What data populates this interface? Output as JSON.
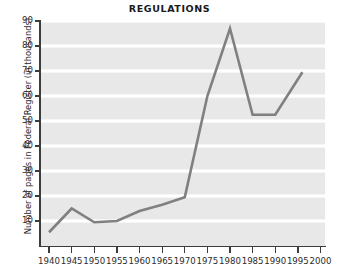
{
  "chart_data": {
    "type": "line",
    "title": "REGULATIONS",
    "xlabel": "",
    "ylabel": "Number of pages in Federal Register (in thousands)",
    "x": [
      1940,
      1945,
      1950,
      1955,
      1960,
      1965,
      1970,
      1975,
      1980,
      1985,
      1990,
      1996
    ],
    "values": [
      5.5,
      15,
      9.5,
      10,
      14,
      16.5,
      19.5,
      60,
      87,
      52.5,
      52.5,
      69.5
    ],
    "series": [
      {
        "name": "Pages in Federal Register",
        "values": [
          5.5,
          15,
          9.5,
          10,
          14,
          16.5,
          19.5,
          60,
          87,
          52.5,
          52.5,
          69.5
        ]
      }
    ],
    "xlim": [
      1938,
      2001
    ],
    "ylim": [
      0,
      90
    ],
    "xticks": [
      1940,
      1945,
      1950,
      1955,
      1960,
      1965,
      1970,
      1975,
      1980,
      1985,
      1990,
      1995,
      2000
    ],
    "xtick_labels": [
      "1940",
      "1945",
      "1950",
      "1955",
      "1960",
      "1965",
      "1970",
      "1975",
      "1980",
      "1985",
      "1990",
      "1995",
      "2000"
    ],
    "yticks": [
      10,
      20,
      30,
      40,
      50,
      60,
      70,
      80,
      90
    ],
    "ytick_labels": [
      "10",
      "20",
      "30",
      "40",
      "50",
      "60",
      "70",
      "80",
      "90"
    ],
    "grid": "horizontal",
    "grid_color": "#ffffff",
    "plot_background": "#e8e8e8",
    "line_color": "#808080",
    "axis_color": "#3c3c3c",
    "legend": null,
    "annotations": []
  }
}
